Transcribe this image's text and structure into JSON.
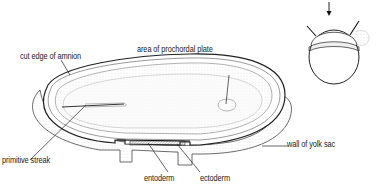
{
  "figure": {
    "type": "anatomical illustration",
    "labels": {
      "cut_edge_of_amnion": "cut edge of amnion",
      "area_of_prochordal_plate": "area of prochordal plate",
      "primitive_streak": "primitive streak",
      "entoderm": "entoderm",
      "ectoderm": "ectoderm",
      "wall_of_yolk_sac": "wall of yolk sac"
    },
    "inset": {
      "description": "orientation inset of embryo with cut lines and viewing arrow"
    }
  }
}
